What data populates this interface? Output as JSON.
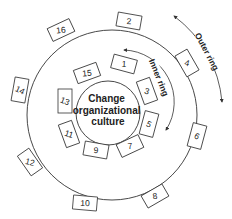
{
  "diagram": {
    "center_label_lines": [
      "Change",
      "organizational",
      "culture"
    ],
    "inner_ring_label": "Inner ring",
    "outer_ring_label": "Outer ring",
    "inner_boxes": [
      {
        "label": "1",
        "x": 124,
        "y": 64,
        "rot": 15
      },
      {
        "label": "3",
        "x": 147,
        "y": 91,
        "rot": 70
      },
      {
        "label": "5",
        "x": 149,
        "y": 124,
        "rot": 105
      },
      {
        "label": "7",
        "x": 130,
        "y": 146,
        "rot": -25
      },
      {
        "label": "9",
        "x": 96,
        "y": 150,
        "rot": 10
      },
      {
        "label": "11",
        "x": 69,
        "y": 134,
        "rot": 70
      },
      {
        "label": "13",
        "x": 65,
        "y": 101,
        "rot": 90
      },
      {
        "label": "15",
        "x": 87,
        "y": 73,
        "rot": -20
      }
    ],
    "outer_boxes": [
      {
        "label": "2",
        "x": 129,
        "y": 21,
        "rot": 10
      },
      {
        "label": "4",
        "x": 187,
        "y": 63,
        "rot": 60
      },
      {
        "label": "6",
        "x": 197,
        "y": 136,
        "rot": 105
      },
      {
        "label": "8",
        "x": 155,
        "y": 196,
        "rot": -30
      },
      {
        "label": "10",
        "x": 85,
        "y": 203,
        "rot": 5
      },
      {
        "label": "12",
        "x": 30,
        "y": 162,
        "rot": 55
      },
      {
        "label": "14",
        "x": 20,
        "y": 90,
        "rot": 100
      },
      {
        "label": "16",
        "x": 61,
        "y": 30,
        "rot": -25
      }
    ],
    "colors": {
      "stroke": "#333333",
      "text": "#222222",
      "background": "#ffffff"
    }
  }
}
